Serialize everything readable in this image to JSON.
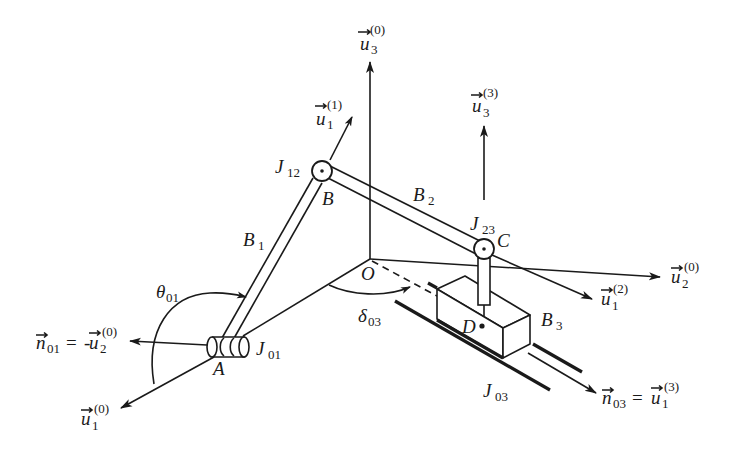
{
  "diagram": {
    "points": {
      "A": "A",
      "B": "B",
      "C": "C",
      "D": "D",
      "O": "O"
    },
    "bodies": {
      "B1": {
        "base": "B",
        "sub": "1"
      },
      "B2": {
        "base": "B",
        "sub": "2"
      },
      "B3": {
        "base": "B",
        "sub": "3"
      }
    },
    "joints": {
      "J01": {
        "base": "J",
        "sub": "01"
      },
      "J12": {
        "base": "J",
        "sub": "12"
      },
      "J23": {
        "base": "J",
        "sub": "23"
      },
      "J03": {
        "base": "J",
        "sub": "03"
      }
    },
    "angles": {
      "theta01": {
        "base": "θ",
        "sub": "01"
      },
      "delta03": {
        "base": "δ",
        "sub": "03"
      }
    },
    "vectors": {
      "u3_0": {
        "base": "u",
        "sub": "3",
        "sup": "(0)"
      },
      "u2_0": {
        "base": "u",
        "sub": "2",
        "sup": "(0)"
      },
      "u1_0": {
        "base": "u",
        "sub": "1",
        "sup": "(0)"
      },
      "u1_1": {
        "base": "u",
        "sub": "1",
        "sup": "(1)"
      },
      "u1_2": {
        "base": "u",
        "sub": "1",
        "sup": "(2)"
      },
      "u3_3": {
        "base": "u",
        "sub": "3",
        "sup": "(3)"
      },
      "n01_eq": {
        "lhs_base": "n",
        "lhs_sub": "01",
        "eq": "=",
        "minus": "-",
        "rhs_base": "u",
        "rhs_sub": "2",
        "rhs_sup": "(0)"
      },
      "n03_eq": {
        "lhs_base": "n",
        "lhs_sub": "03",
        "eq": "=",
        "rhs_base": "u",
        "rhs_sub": "1",
        "rhs_sup": "(3)"
      }
    },
    "colors": {
      "ink": "#1a1a1a",
      "background": "#ffffff"
    }
  }
}
